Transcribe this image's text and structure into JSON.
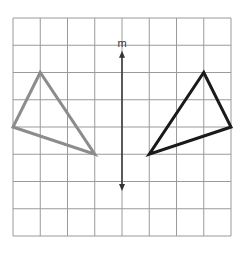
{
  "diagram": {
    "type": "reflection-on-grid",
    "grid": {
      "columns": 8,
      "rows": 8,
      "origin_px": [
        13,
        18
      ],
      "cell_px": 27.25,
      "line_color": "#9a9a9a"
    },
    "line_of_reflection": {
      "label": "m",
      "grid_x": 4,
      "from_grid_y": 1.2,
      "to_grid_y": 6.35,
      "color": "#333333",
      "arrows": "both"
    },
    "triangles": [
      {
        "name": "preimage",
        "color": "#8c8c8c",
        "vertices": [
          [
            1,
            2
          ],
          [
            0,
            4
          ],
          [
            3,
            5
          ]
        ]
      },
      {
        "name": "image",
        "color": "#1a1a1a",
        "vertices": [
          [
            7,
            2
          ],
          [
            8,
            4
          ],
          [
            5,
            5
          ]
        ]
      }
    ]
  }
}
